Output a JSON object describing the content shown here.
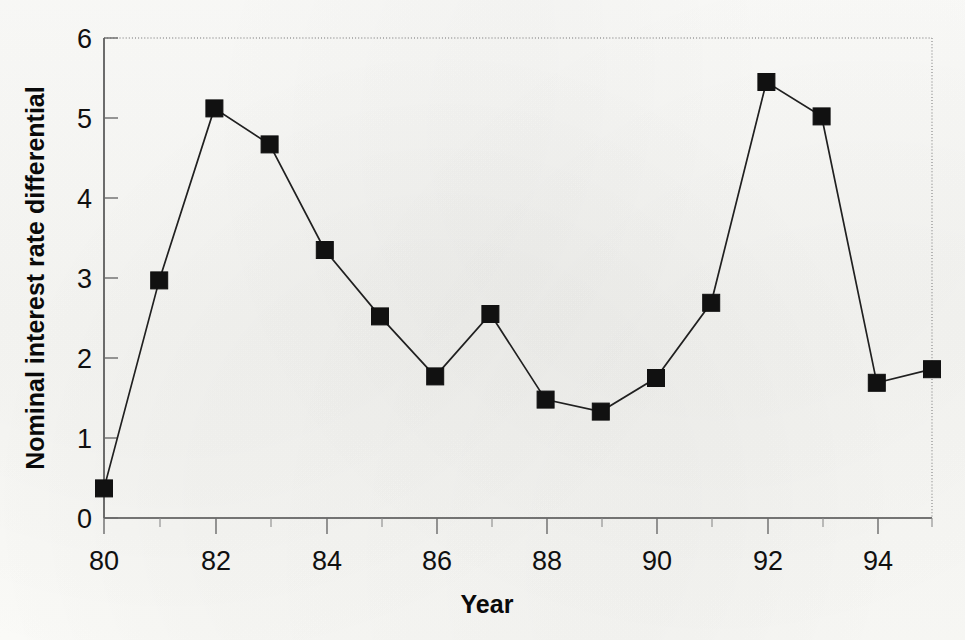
{
  "chart_data": {
    "type": "line",
    "title": "",
    "xlabel": "Year",
    "ylabel": "Nominal interest rate  differential",
    "xlim": [
      80,
      95
    ],
    "ylim": [
      0,
      6
    ],
    "xticks": [
      80,
      82,
      84,
      86,
      88,
      90,
      92,
      94
    ],
    "xtick_labels": [
      "80",
      "82",
      "84",
      "86",
      "88",
      "90",
      "92",
      "94"
    ],
    "yticks": [
      0,
      1,
      2,
      3,
      4,
      5,
      6
    ],
    "ytick_labels": [
      "0",
      "1",
      "2",
      "3",
      "4",
      "5",
      "6"
    ],
    "x": [
      80,
      81,
      82,
      83,
      84,
      85,
      86,
      87,
      88,
      89,
      90,
      91,
      92,
      93,
      94,
      95
    ],
    "values": [
      0.37,
      2.97,
      5.12,
      4.67,
      3.35,
      2.52,
      1.77,
      2.55,
      1.48,
      1.33,
      1.75,
      2.69,
      5.45,
      5.02,
      1.69,
      1.86
    ],
    "series": [
      {
        "name": "Nominal interest rate differential",
        "values": [
          0.37,
          2.97,
          5.12,
          4.67,
          3.35,
          2.52,
          1.77,
          2.55,
          1.48,
          1.33,
          1.75,
          2.69,
          5.45,
          5.02,
          1.69,
          1.86
        ]
      }
    ],
    "marker": "square",
    "marker_color": "#111111",
    "line_color": "#202020",
    "grid": false,
    "legend": false,
    "legend_position": "none",
    "minor_xticks_every": 1,
    "background_color": "#fbfbf9",
    "frame": {
      "left": "solid",
      "bottom": "solid",
      "top": "dotted",
      "right": "dotted"
    }
  }
}
